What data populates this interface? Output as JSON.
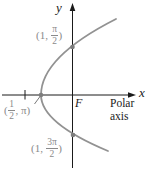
{
  "figure": {
    "y_axis_label": "y",
    "x_axis_label": "x",
    "polar_axis_caption": "Polar axis",
    "focus_label": "F",
    "point_labels": [
      {
        "meaning": "point (1, pi/2) on positive y-axis",
        "prefix": "(1, ",
        "frac_num": "π",
        "frac_den": "2",
        "suffix": ")"
      },
      {
        "meaning": "vertex point (1/2, pi) on negative x-axis",
        "prefix": "(",
        "frac_num": "1",
        "frac_den": "2",
        "suffix": ", π)"
      },
      {
        "meaning": "point (1, 3pi/2) on negative y-axis",
        "prefix": "(1, ",
        "frac_num": "3π",
        "frac_den": "2",
        "suffix": ")"
      }
    ],
    "colors": {
      "curve": "#929292",
      "point_dot": "#7d7d7d",
      "point_label_text": "#8a8a8a",
      "axis": "#1a1a1a"
    }
  }
}
